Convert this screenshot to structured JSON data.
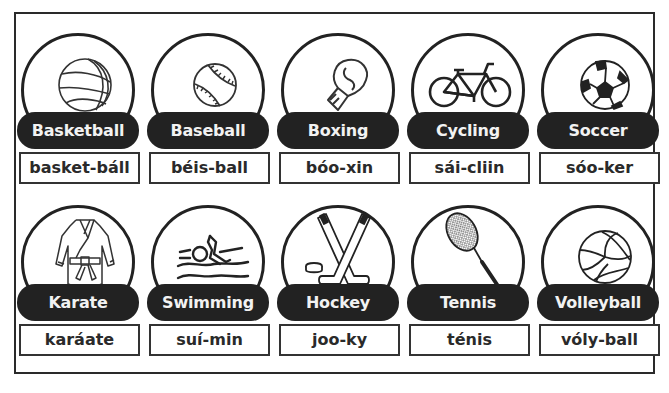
{
  "cards": [
    {
      "label": "Basketball",
      "pronunciation": "basket-báll",
      "icon": "basketball-icon"
    },
    {
      "label": "Baseball",
      "pronunciation": "béis-ball",
      "icon": "baseball-icon"
    },
    {
      "label": "Boxing",
      "pronunciation": "bóo-xin",
      "icon": "boxing-glove-icon"
    },
    {
      "label": "Cycling",
      "pronunciation": "sái-cliin",
      "icon": "bicycle-icon"
    },
    {
      "label": "Soccer",
      "pronunciation": "sóo-ker",
      "icon": "soccer-ball-icon"
    },
    {
      "label": "Karate",
      "pronunciation": "karáate",
      "icon": "karate-gi-icon"
    },
    {
      "label": "Swimming",
      "pronunciation": "suí-min",
      "icon": "swimmer-icon"
    },
    {
      "label": "Hockey",
      "pronunciation": "joo-ky",
      "icon": "hockey-sticks-icon"
    },
    {
      "label": "Tennis",
      "pronunciation": "ténis",
      "icon": "tennis-racket-icon"
    },
    {
      "label": "Volleyball",
      "pronunciation": "vóly-ball",
      "icon": "volleyball-icon"
    }
  ],
  "colors": {
    "ink": "#222222",
    "paper": "#ffffff",
    "pill_text": "#f2f2f2"
  }
}
